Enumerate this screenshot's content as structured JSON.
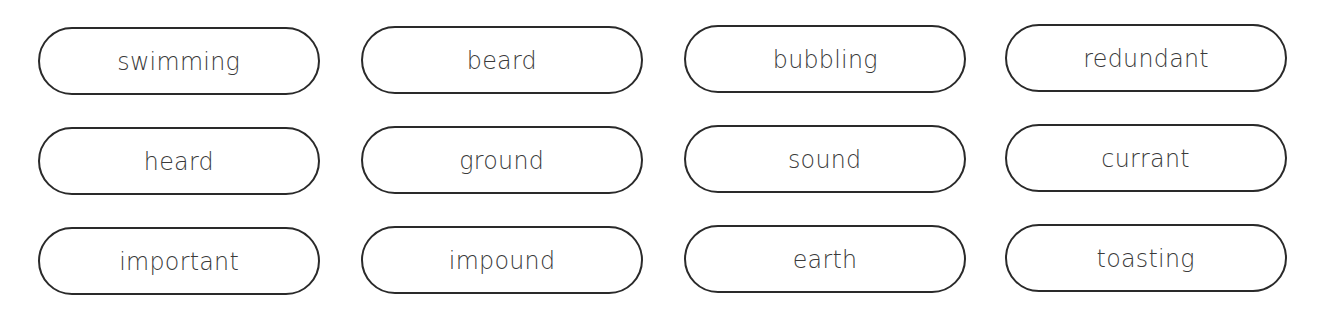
{
  "word_cards": [
    {
      "word": "swimming",
      "x": 38,
      "y": 27
    },
    {
      "word": "beard",
      "x": 361,
      "y": 26
    },
    {
      "word": "bubbling",
      "x": 684,
      "y": 25
    },
    {
      "word": "redundant",
      "x": 1005,
      "y": 24
    },
    {
      "word": "heard",
      "x": 38,
      "y": 127
    },
    {
      "word": "ground",
      "x": 361,
      "y": 126
    },
    {
      "word": "sound",
      "x": 684,
      "y": 125
    },
    {
      "word": "currant",
      "x": 1005,
      "y": 124
    },
    {
      "word": "important",
      "x": 38,
      "y": 227
    },
    {
      "word": "impound",
      "x": 361,
      "y": 226
    },
    {
      "word": "earth",
      "x": 684,
      "y": 225
    },
    {
      "word": "toasting",
      "x": 1005,
      "y": 224
    }
  ],
  "colors": {
    "border": "#2a2a2a",
    "text": "#3a3a3a",
    "background": "#ffffff"
  }
}
